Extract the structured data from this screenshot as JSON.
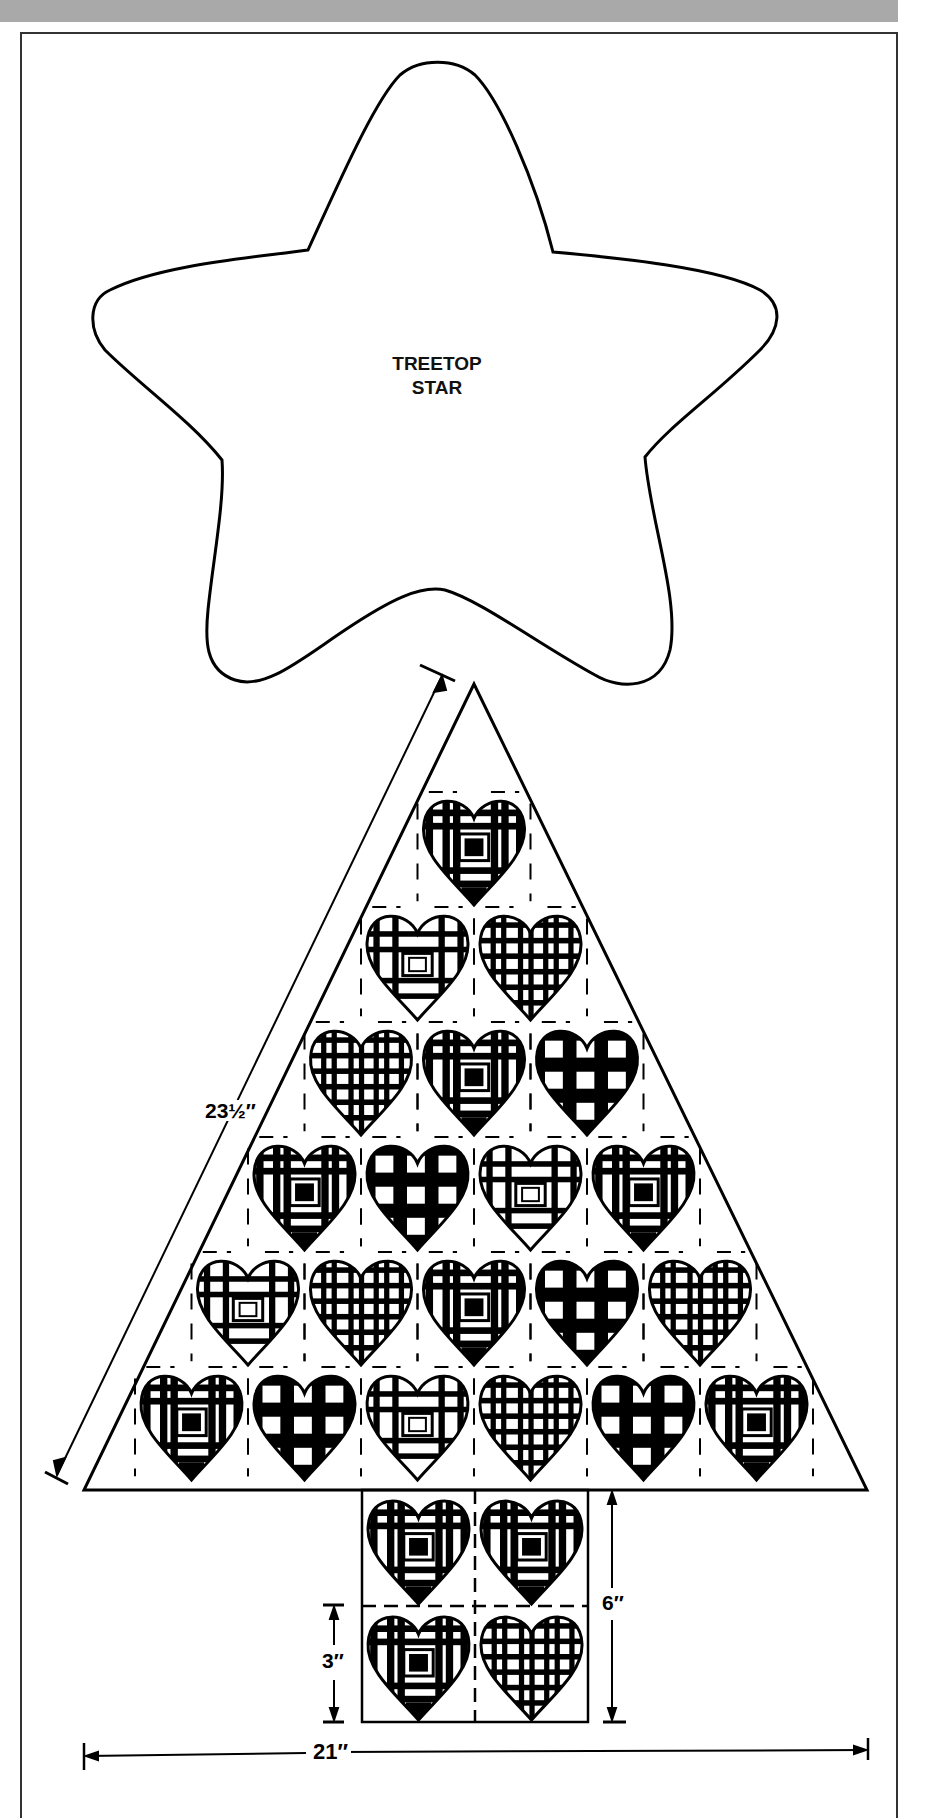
{
  "header": {
    "band_color": "#a9a9a9"
  },
  "star": {
    "label_line1": "TREETOP",
    "label_line2": "STAR"
  },
  "tree": {
    "apex": [
      474,
      684
    ],
    "base_left": [
      84,
      1490
    ],
    "base_right": [
      867,
      1490
    ],
    "cell_width": 113,
    "row_height": 115,
    "top_row_y": 798,
    "rows": [
      [
        "plaid-square"
      ],
      [
        "plaid-box",
        "plaid-fine"
      ],
      [
        "plaid-fine",
        "plaid-square",
        "gingham"
      ],
      [
        "plaid-square",
        "gingham",
        "plaid-box",
        "plaid-square"
      ],
      [
        "plaid-box",
        "plaid-fine",
        "plaid-square",
        "gingham",
        "plaid-fine"
      ],
      [
        "plaid-square",
        "gingham",
        "plaid-box",
        "plaid-fine",
        "gingham",
        "plaid-square"
      ]
    ],
    "trunk": {
      "x": 362,
      "y": 1490,
      "rows": [
        [
          "plaid-square",
          "plaid-square"
        ],
        [
          "plaid-square",
          "plaid-fine"
        ]
      ]
    }
  },
  "dimensions": {
    "diagonal_label": "23½″",
    "trunk_height_label": "6″",
    "heart_height_label": "3″",
    "width_label": "21″"
  }
}
